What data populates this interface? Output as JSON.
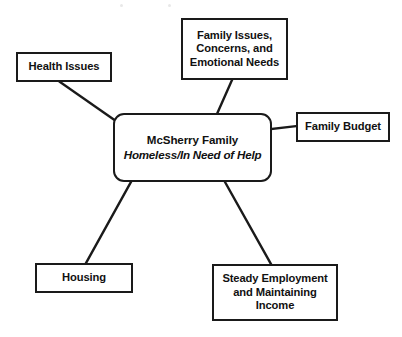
{
  "diagram": {
    "type": "concept-map",
    "background_color": "#ffffff",
    "stroke_color": "#1a1a1a",
    "text_color": "#111111",
    "center": {
      "id": "center",
      "name": "McSherry Family",
      "descriptor": "Homeless/In Need of Help",
      "shape": "rounded-rectangle",
      "x": 113,
      "y": 113,
      "width": 159,
      "height": 69
    },
    "nodes": [
      {
        "id": "health-issues",
        "lines": [
          "Health Issues"
        ],
        "x": 16,
        "y": 52,
        "width": 96,
        "height": 30
      },
      {
        "id": "family-issues",
        "lines": [
          "Family Issues,",
          "Concerns, and",
          "Emotional Needs"
        ],
        "x": 181,
        "y": 18,
        "width": 107,
        "height": 62
      },
      {
        "id": "family-budget",
        "lines": [
          "Family Budget"
        ],
        "x": 296,
        "y": 112,
        "width": 94,
        "height": 30
      },
      {
        "id": "housing",
        "lines": [
          "Housing"
        ],
        "x": 35,
        "y": 263,
        "width": 98,
        "height": 30
      },
      {
        "id": "steady-employment",
        "lines": [
          "Steady Employment",
          "and Maintaining",
          "Income"
        ],
        "x": 212,
        "y": 264,
        "width": 126,
        "height": 57
      }
    ],
    "connectors": [
      {
        "id": "center-to-health-issues",
        "from": "center",
        "to": "health-issues",
        "x1": 60,
        "y1": 82,
        "x2": 116,
        "y2": 121
      },
      {
        "id": "center-to-family-issues",
        "from": "center",
        "to": "family-issues",
        "x1": 232,
        "y1": 80,
        "x2": 217,
        "y2": 114
      },
      {
        "id": "center-to-family-budget",
        "from": "center",
        "to": "family-budget",
        "x1": 272,
        "y1": 129,
        "x2": 296,
        "y2": 126
      },
      {
        "id": "center-to-housing",
        "from": "center",
        "to": "housing",
        "x1": 131,
        "y1": 182,
        "x2": 86,
        "y2": 263
      },
      {
        "id": "center-to-steady-employment",
        "from": "center",
        "to": "steady-employment",
        "x1": 225,
        "y1": 182,
        "x2": 271,
        "y2": 264
      }
    ]
  }
}
